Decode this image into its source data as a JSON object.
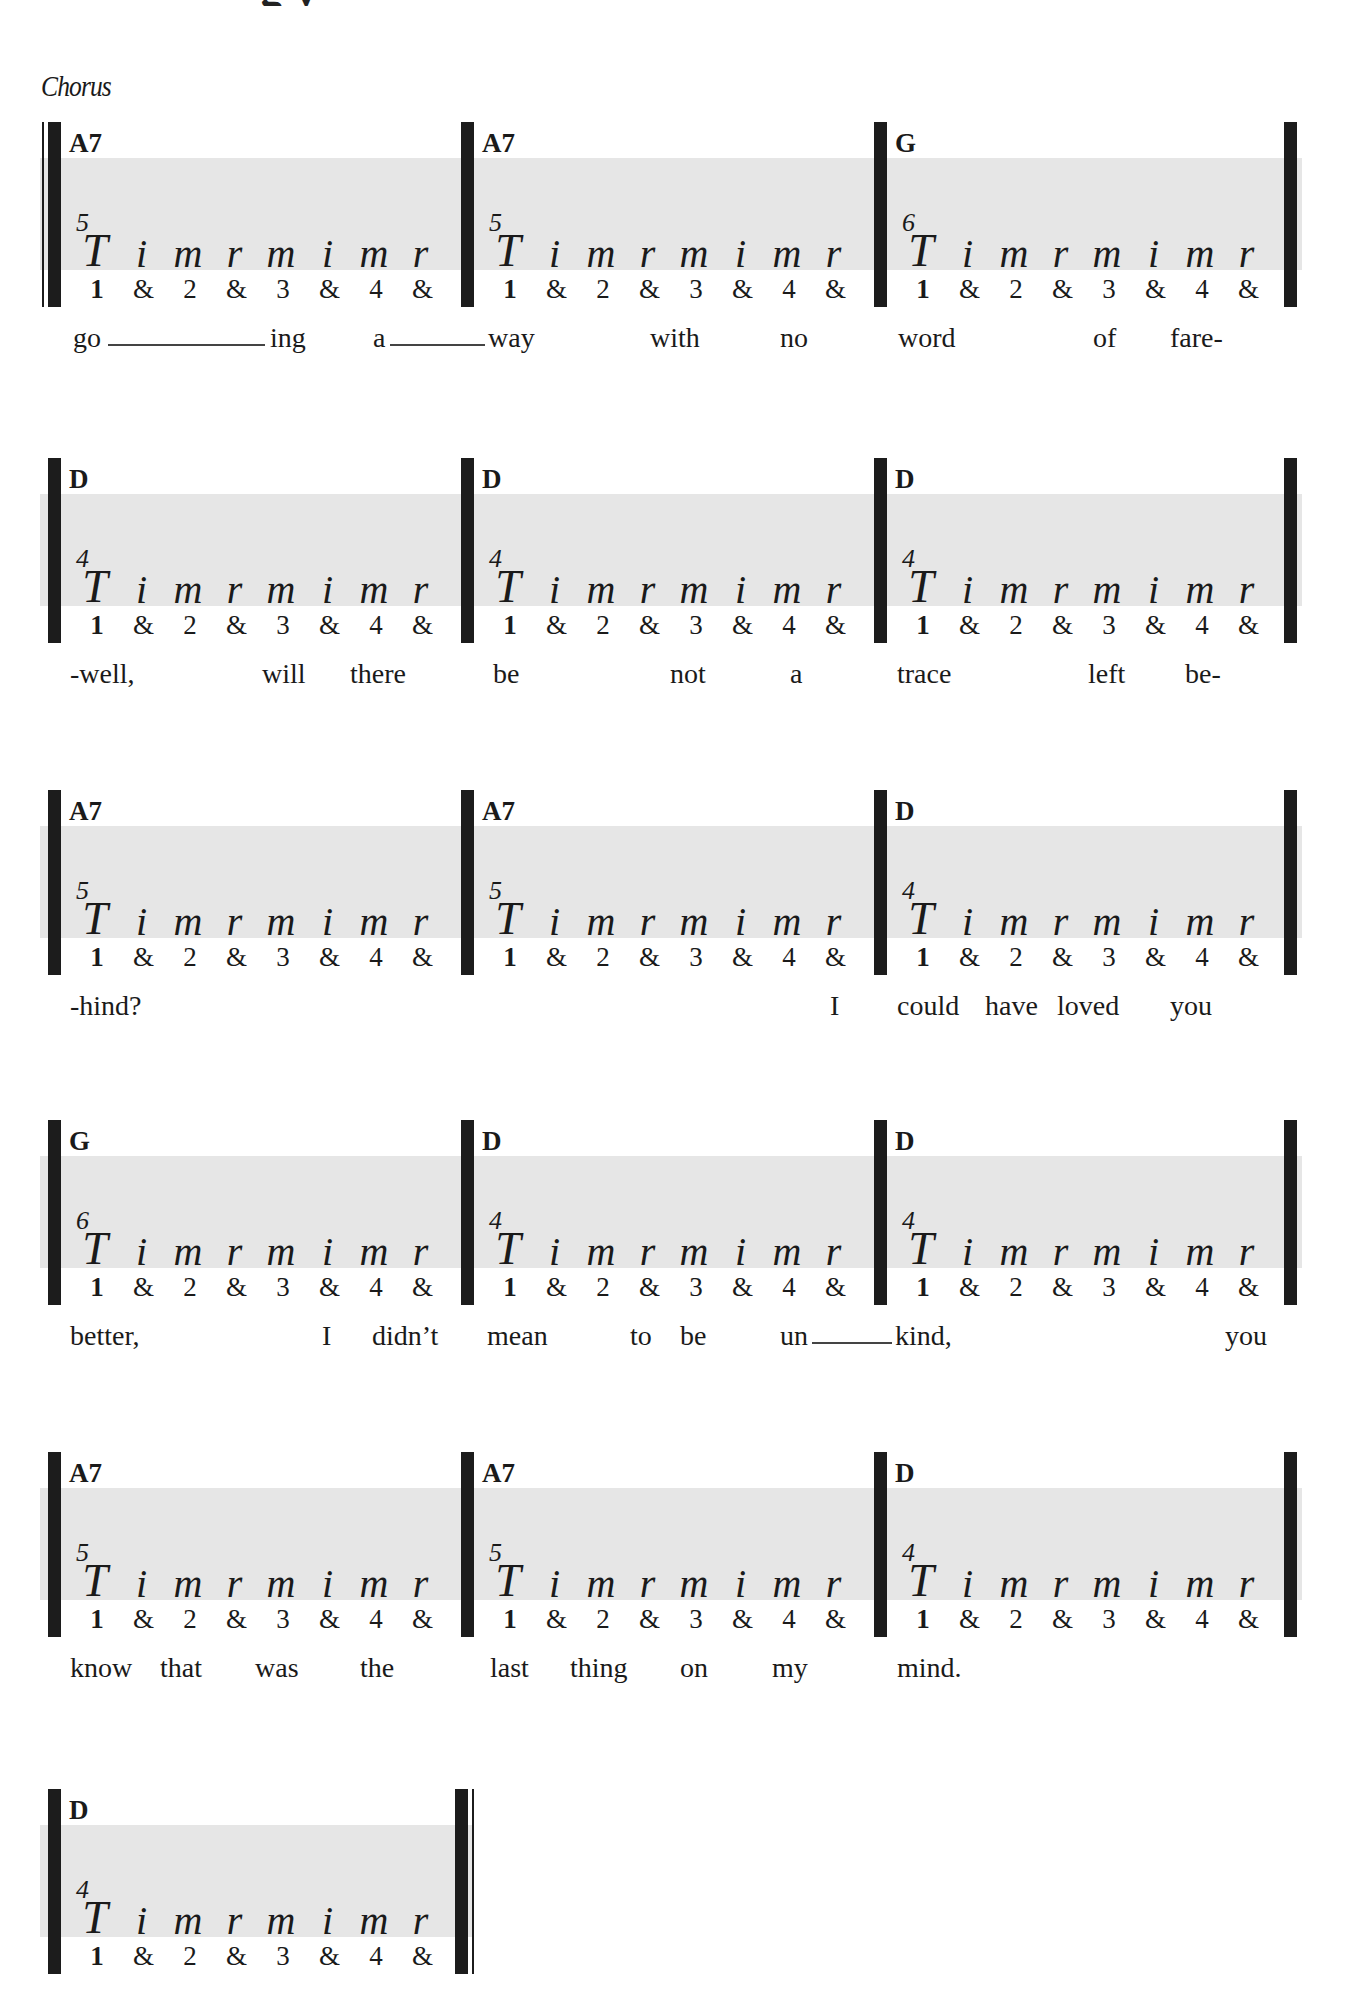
{
  "page": {
    "title_fragment": "g          y",
    "section_label": "Chorus"
  },
  "pattern": {
    "fingers": [
      "T",
      "i",
      "m",
      "r",
      "m",
      "i",
      "m",
      "r"
    ],
    "counts": [
      "1",
      "&",
      "2",
      "&",
      "3",
      "&",
      "4",
      "&"
    ]
  },
  "systems": [
    {
      "measures": [
        {
          "chord": "A7",
          "fret": "5"
        },
        {
          "chord": "A7",
          "fret": "5"
        },
        {
          "chord": "G",
          "fret": "6"
        }
      ],
      "lyrics": [
        {
          "text": "go",
          "x": 73
        },
        {
          "text": "ing",
          "x": 270
        },
        {
          "text": "a",
          "x": 373
        },
        {
          "text": "way",
          "x": 488
        },
        {
          "text": "with",
          "x": 650
        },
        {
          "text": "no",
          "x": 780
        },
        {
          "text": "word",
          "x": 898
        },
        {
          "text": "of",
          "x": 1093
        },
        {
          "text": "fare-",
          "x": 1170
        }
      ],
      "extenders": [
        {
          "x": 108,
          "w": 157
        },
        {
          "x": 390,
          "w": 95
        }
      ]
    },
    {
      "measures": [
        {
          "chord": "D",
          "fret": "4"
        },
        {
          "chord": "D",
          "fret": "4"
        },
        {
          "chord": "D",
          "fret": "4"
        }
      ],
      "lyrics": [
        {
          "text": "-well,",
          "x": 70
        },
        {
          "text": "will",
          "x": 262
        },
        {
          "text": "there",
          "x": 350
        },
        {
          "text": "be",
          "x": 493
        },
        {
          "text": "not",
          "x": 670
        },
        {
          "text": "a",
          "x": 790
        },
        {
          "text": "trace",
          "x": 897
        },
        {
          "text": "left",
          "x": 1088
        },
        {
          "text": "be-",
          "x": 1185
        }
      ],
      "extenders": []
    },
    {
      "measures": [
        {
          "chord": "A7",
          "fret": "5"
        },
        {
          "chord": "A7",
          "fret": "5"
        },
        {
          "chord": "D",
          "fret": "4"
        }
      ],
      "lyrics": [
        {
          "text": "-hind?",
          "x": 70
        },
        {
          "text": "I",
          "x": 830
        },
        {
          "text": "could",
          "x": 897
        },
        {
          "text": "have",
          "x": 985
        },
        {
          "text": "loved",
          "x": 1057
        },
        {
          "text": "you",
          "x": 1170
        }
      ],
      "extenders": []
    },
    {
      "measures": [
        {
          "chord": "G",
          "fret": "6"
        },
        {
          "chord": "D",
          "fret": "4"
        },
        {
          "chord": "D",
          "fret": "4"
        }
      ],
      "lyrics": [
        {
          "text": "better,",
          "x": 70
        },
        {
          "text": "I",
          "x": 322
        },
        {
          "text": "didn’t",
          "x": 372
        },
        {
          "text": "mean",
          "x": 487
        },
        {
          "text": "to",
          "x": 630
        },
        {
          "text": "be",
          "x": 680
        },
        {
          "text": "un",
          "x": 780
        },
        {
          "text": "kind,",
          "x": 895
        },
        {
          "text": "you",
          "x": 1225
        }
      ],
      "extenders": [
        {
          "x": 812,
          "w": 80
        }
      ]
    },
    {
      "measures": [
        {
          "chord": "A7",
          "fret": "5"
        },
        {
          "chord": "A7",
          "fret": "5"
        },
        {
          "chord": "D",
          "fret": "4"
        }
      ],
      "lyrics": [
        {
          "text": "know",
          "x": 70
        },
        {
          "text": "that",
          "x": 160
        },
        {
          "text": "was",
          "x": 255
        },
        {
          "text": "the",
          "x": 360
        },
        {
          "text": "last",
          "x": 490
        },
        {
          "text": "thing",
          "x": 570
        },
        {
          "text": "on",
          "x": 680
        },
        {
          "text": "my",
          "x": 772
        },
        {
          "text": "mind.",
          "x": 897
        }
      ],
      "extenders": []
    },
    {
      "measures": [
        {
          "chord": "D",
          "fret": "4"
        }
      ],
      "lyrics": [],
      "extenders": []
    }
  ]
}
